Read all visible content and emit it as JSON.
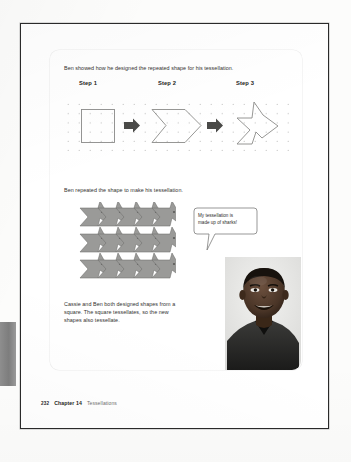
{
  "page": {
    "intro_text": "Ben showed how he designed the repeated shape for his tessellation.",
    "repeat_text": "Ben repeated the shape to make his tessellation.",
    "conclusion_text": "Cassie and Ben both designed shapes from a square. The square tessellates, so the new shapes also tessellate."
  },
  "steps": [
    {
      "label": "Step 1",
      "shape": "square"
    },
    {
      "label": "Step 2",
      "shape": "notched-arrow"
    },
    {
      "label": "Step 3",
      "shape": "shark"
    }
  ],
  "arrows": [
    {
      "icon": "right-arrow-icon"
    },
    {
      "icon": "right-arrow-icon"
    }
  ],
  "speech_bubble": {
    "text": "My tessellation is\nmade up of sharks!",
    "speaker": "boy-photo"
  },
  "figures": {
    "dot_grid": {
      "name": "dot-grid",
      "columns": 22,
      "rows": 7,
      "dot_color": "#b9b9b7"
    },
    "tessellation": {
      "name": "shark-tessellation",
      "rows": 3,
      "columns": 5,
      "fill_color": "#9a9a98"
    },
    "photo": {
      "name": "boy-photo",
      "alt": "smiling boy"
    }
  },
  "footer": {
    "page_number": "232",
    "chapter": "Chapter 14",
    "topic": "Tessellations"
  },
  "colors": {
    "ink": "#32322f",
    "heading": "#1d1d1b",
    "page_border": "#2a2a2a",
    "shape_stroke": "#8b8b89",
    "arrow": "#4a4a48",
    "tessellation_fill": "#9a9a98",
    "footer_muted": "#6f6f6d",
    "left_tab": "#8e8e8e"
  }
}
